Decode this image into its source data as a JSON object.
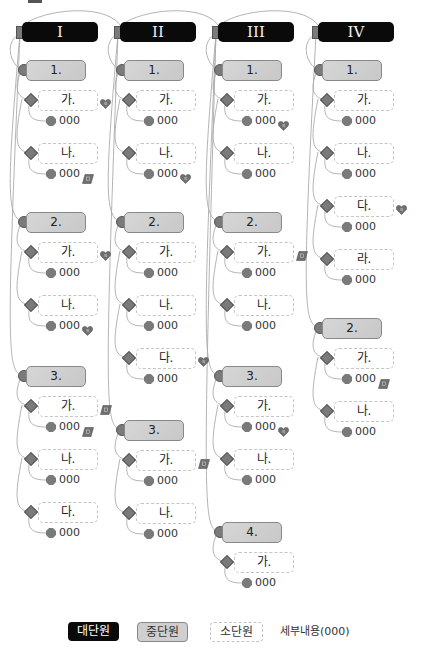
{
  "diagram": {
    "columns": [
      {
        "label": "I",
        "sections": [
          {
            "label": "1.",
            "items": [
              {
                "label": "가.",
                "detail": "000",
                "label_icon": "heart",
                "detail_icon": null
              },
              {
                "label": "나.",
                "detail": "000",
                "label_icon": null,
                "detail_icon": "note"
              }
            ]
          },
          {
            "label": "2.",
            "items": [
              {
                "label": "가.",
                "detail": "000",
                "label_icon": "heart",
                "detail_icon": null
              },
              {
                "label": "나.",
                "detail": "000",
                "label_icon": null,
                "detail_icon": "heart"
              }
            ]
          },
          {
            "label": "3.",
            "items": [
              {
                "label": "가.",
                "detail": "000",
                "label_icon": "note",
                "detail_icon": "note"
              },
              {
                "label": "나.",
                "detail": "000",
                "label_icon": null,
                "detail_icon": null
              },
              {
                "label": "다.",
                "detail": "000",
                "label_icon": null,
                "detail_icon": null
              }
            ]
          }
        ]
      },
      {
        "label": "II",
        "sections": [
          {
            "label": "1.",
            "items": [
              {
                "label": "가.",
                "detail": "000",
                "label_icon": null,
                "detail_icon": null
              },
              {
                "label": "나.",
                "detail": "000",
                "label_icon": null,
                "detail_icon": "heart"
              }
            ]
          },
          {
            "label": "2.",
            "items": [
              {
                "label": "가.",
                "detail": "000",
                "label_icon": null,
                "detail_icon": null
              },
              {
                "label": "나.",
                "detail": "000",
                "label_icon": null,
                "detail_icon": null
              },
              {
                "label": "다.",
                "detail": "000",
                "label_icon": "heart",
                "detail_icon": null
              }
            ]
          },
          {
            "label": "3.",
            "items": [
              {
                "label": "가.",
                "detail": "000",
                "label_icon": "note",
                "detail_icon": null
              },
              {
                "label": "나.",
                "detail": "000",
                "label_icon": null,
                "detail_icon": null
              }
            ]
          }
        ]
      },
      {
        "label": "III",
        "sections": [
          {
            "label": "1.",
            "items": [
              {
                "label": "가.",
                "detail": "000",
                "label_icon": null,
                "detail_icon": "heart"
              },
              {
                "label": "나.",
                "detail": "000",
                "label_icon": null,
                "detail_icon": null
              }
            ]
          },
          {
            "label": "2.",
            "items": [
              {
                "label": "가.",
                "detail": "000",
                "label_icon": "note",
                "detail_icon": null
              },
              {
                "label": "나.",
                "detail": "000",
                "label_icon": null,
                "detail_icon": null
              }
            ]
          },
          {
            "label": "3.",
            "items": [
              {
                "label": "가.",
                "detail": "000",
                "label_icon": null,
                "detail_icon": "heart"
              },
              {
                "label": "나.",
                "detail": "000",
                "label_icon": null,
                "detail_icon": null
              }
            ]
          },
          {
            "label": "4.",
            "items": [
              {
                "label": "가.",
                "detail": "000",
                "label_icon": null,
                "detail_icon": null
              }
            ]
          }
        ]
      },
      {
        "label": "IV",
        "sections": [
          {
            "label": "1.",
            "items": [
              {
                "label": "가.",
                "detail": "000",
                "label_icon": null,
                "detail_icon": null
              },
              {
                "label": "나.",
                "detail": "000",
                "label_icon": null,
                "detail_icon": null
              },
              {
                "label": "다.",
                "detail": "000",
                "label_icon": "heart",
                "detail_icon": null
              },
              {
                "label": "라.",
                "detail": "000",
                "label_icon": null,
                "detail_icon": null
              }
            ]
          },
          {
            "label": "2.",
            "items": [
              {
                "label": "가.",
                "detail": "000",
                "label_icon": null,
                "detail_icon": "note"
              },
              {
                "label": "나.",
                "detail": "000",
                "label_icon": null,
                "detail_icon": null
              }
            ]
          }
        ]
      }
    ]
  },
  "legend": {
    "major": "대단원",
    "mid": "중단원",
    "minor": "소단원",
    "detail": "세부내용(000)"
  },
  "colors": {
    "major_fill": "#0a0a0a",
    "mid_fill": "#cfcfcf",
    "minor_border": "#c4c4c4",
    "marker": "#7a7a7a",
    "link": "#aaaaaa"
  }
}
